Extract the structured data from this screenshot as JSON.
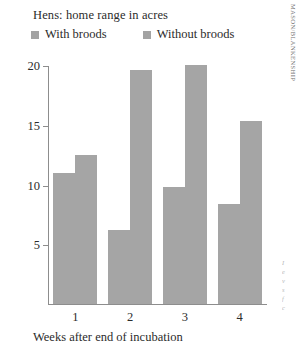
{
  "chart_data": {
    "type": "bar",
    "title": "Hens: home range in acres",
    "xlabel": "Weeks after end of incubation",
    "ylabel": "",
    "categories": [
      "1",
      "2",
      "3",
      "4"
    ],
    "series": [
      {
        "name": "With broods",
        "values": [
          11.0,
          6.2,
          9.8,
          8.4
        ]
      },
      {
        "name": "Without broods",
        "values": [
          12.5,
          19.6,
          20.0,
          15.3
        ]
      }
    ],
    "ylim": [
      0,
      20
    ],
    "yticks": [
      5,
      10,
      15,
      20
    ],
    "ytick_labels": [
      "5",
      "10",
      "15",
      "20"
    ],
    "grid": false,
    "legend_position": "top-left",
    "bar_color": "#a5a5a5"
  },
  "credit": "MASON/BLANKENSHIP",
  "margin_text": [
    "I",
    "e",
    "v",
    "s",
    "f",
    "c"
  ]
}
